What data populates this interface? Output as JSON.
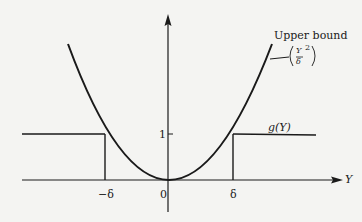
{
  "figure": {
    "type": "function plot",
    "x_axis": {
      "label": "Y",
      "ticks": [
        {
          "label": "-δ",
          "x": 105
        },
        {
          "label": "0",
          "x": 168
        },
        {
          "label": "δ",
          "x": 233
        }
      ]
    },
    "y_axis": {
      "ticks": [
        {
          "label": "1",
          "y": 134
        }
      ]
    },
    "curves": [
      {
        "name": "Upper bound",
        "formula": "(Y/δ)^2",
        "kind": "parabola"
      },
      {
        "name": "g(Y)",
        "kind": "step: 0 for |Y|<δ, 1 for |Y|≥δ"
      }
    ]
  },
  "labels": {
    "upper_bound": "Upper bound",
    "formula_num": "Y",
    "formula_den": "δ",
    "formula_exp": "2",
    "g": "g(Y)",
    "one": "1",
    "zero": "0",
    "neg_delta": "−δ",
    "delta": "δ",
    "y_axis_var": "Y"
  },
  "colors": {
    "ink": "#1a1a1a",
    "paper": "#f4f4f2"
  }
}
